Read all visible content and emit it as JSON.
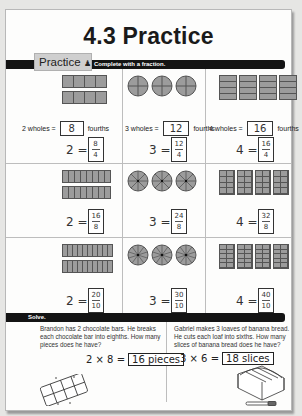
{
  "title": "4.3 Practice",
  "practice_badge": {
    "label": "Practice",
    "icon": "person-icon"
  },
  "instruction": "Complete with a fraction.",
  "rows": [
    {
      "cells": [
        {
          "shape": "rectangle-bars",
          "wholes": 2,
          "parts": 4,
          "equation": {
            "prefix": "2 wholes =",
            "answer": "8",
            "suffix": "fourths"
          },
          "fraction": {
            "whole": "2 =",
            "numerator": "8",
            "denominator": "4"
          }
        },
        {
          "shape": "circles",
          "wholes": 3,
          "parts": 4,
          "equation": {
            "prefix": "3 wholes =",
            "answer": "12",
            "suffix": "fourths"
          },
          "fraction": {
            "whole": "3 =",
            "numerator": "12",
            "denominator": "4"
          }
        },
        {
          "shape": "stacks",
          "wholes": 4,
          "parts": 4,
          "equation": {
            "prefix": "4 wholes =",
            "answer": "16",
            "suffix": "fourths"
          },
          "fraction": {
            "whole": "4 =",
            "numerator": "16",
            "denominator": "4"
          }
        }
      ]
    },
    {
      "cells": [
        {
          "shape": "rectangle-bars",
          "wholes": 2,
          "parts": 8,
          "fraction": {
            "whole": "2 =",
            "numerator": "16",
            "denominator": "8"
          }
        },
        {
          "shape": "circles",
          "wholes": 3,
          "parts": 8,
          "fraction": {
            "whole": "3 =",
            "numerator": "24",
            "denominator": "8"
          }
        },
        {
          "shape": "blocks",
          "wholes": 4,
          "parts": 8,
          "fraction": {
            "whole": "4 =",
            "numerator": "32",
            "denominator": "8"
          }
        }
      ]
    },
    {
      "cells": [
        {
          "shape": "rectangle-bars",
          "wholes": 2,
          "parts": 10,
          "fraction": {
            "whole": "2 =",
            "numerator": "20",
            "denominator": "10"
          }
        },
        {
          "shape": "circles",
          "wholes": 3,
          "parts": 10,
          "fraction": {
            "whole": "3 =",
            "numerator": "30",
            "denominator": "10"
          }
        },
        {
          "shape": "blocks",
          "wholes": 4,
          "parts": 10,
          "fraction": {
            "whole": "4 =",
            "numerator": "40",
            "denominator": "10"
          }
        }
      ]
    }
  ],
  "solve": {
    "label": "Solve.",
    "problems": [
      {
        "text": "Brandon has 2 chocolate bars. He breaks each chocolate bar into eighths. How many pieces does he have?",
        "equation": "2 × 8 =",
        "answer": "16 pieces",
        "illustration": "chocolate-bar-icon"
      },
      {
        "text": "Gabriel makes 3 loaves of banana bread. He cuts each loaf into sixths. How many slices of banana bread does he have?",
        "equation": "3 × 6 =",
        "answer": "18 slices",
        "illustration": "banana-bread-icon"
      }
    ]
  },
  "colors": {
    "shape_fill": "#9c9c9c",
    "shape_stroke": "#555555",
    "bar": "#141414",
    "badge_bg": "#cfcfcf"
  }
}
